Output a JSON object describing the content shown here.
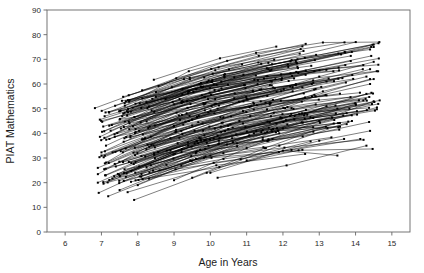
{
  "chart_data": {
    "type": "line",
    "title": "",
    "subtitle": "",
    "xlabel": "Age in Years",
    "ylabel": "PIAT Mathematics",
    "xlim": [
      5.5,
      15.5
    ],
    "ylim": [
      0,
      90
    ],
    "xticks": [
      6,
      7,
      8,
      9,
      10,
      11,
      12,
      13,
      14,
      15
    ],
    "yticks": [
      0,
      10,
      20,
      30,
      40,
      50,
      60,
      70,
      80,
      90
    ],
    "xtick_labels": [
      "6",
      "7",
      "8",
      "9",
      "10",
      "11",
      "12",
      "13",
      "14",
      "15"
    ],
    "ytick_labels": [
      "0",
      "10",
      "20",
      "30",
      "40",
      "50",
      "60",
      "70",
      "80",
      "90"
    ],
    "grid": false,
    "legend": false,
    "legend_position": "none",
    "marker": "filled-square",
    "marker_size": 2,
    "line_color": "#000000",
    "line_width": 0.5,
    "observed_x_range": [
      6.9,
      14.6
    ],
    "observed_y_range": [
      13,
      76
    ],
    "n_series_approx": 180,
    "series": [
      {
        "name": "child-001",
        "x": [
          6.9,
          8.9,
          10.9,
          12.9,
          14.4
        ],
        "values": [
          20,
          33,
          44,
          55,
          60
        ]
      },
      {
        "name": "child-002",
        "x": [
          6.9,
          8.9,
          10.9,
          12.9,
          14.3
        ],
        "values": [
          26,
          38,
          49,
          58,
          63
        ]
      },
      {
        "name": "child-003",
        "x": [
          7.0,
          9.0,
          11.0,
          13.0,
          14.5
        ],
        "values": [
          31,
          43,
          54,
          63,
          69
        ]
      },
      {
        "name": "child-004",
        "x": [
          7.1,
          9.1,
          11.1,
          13.1,
          14.5
        ],
        "values": [
          23,
          36,
          47,
          57,
          62
        ]
      },
      {
        "name": "child-005",
        "x": [
          7.2,
          9.2,
          11.2,
          13.2,
          14.4
        ],
        "values": [
          28,
          41,
          52,
          61,
          66
        ]
      },
      {
        "name": "child-006",
        "x": [
          7.5,
          9.5,
          11.5,
          13.5
        ],
        "values": [
          17,
          29,
          40,
          50
        ]
      },
      {
        "name": "child-007",
        "x": [
          7.6,
          9.6,
          11.6,
          13.6,
          14.5
        ],
        "values": [
          48,
          58,
          66,
          72,
          75
        ]
      },
      {
        "name": "child-008",
        "x": [
          7.7,
          9.7,
          11.7,
          13.7,
          14.5
        ],
        "values": [
          49,
          60,
          68,
          73,
          76
        ]
      },
      {
        "name": "child-009",
        "x": [
          7.9,
          9.9,
          11.9,
          13.9
        ],
        "values": [
          13,
          24,
          35,
          45
        ]
      },
      {
        "name": "child-010",
        "x": [
          8.0,
          10.0,
          12.0,
          14.0
        ],
        "values": [
          19,
          31,
          42,
          52
        ]
      },
      {
        "name": "child-011",
        "x": [
          8.2,
          10.2,
          12.2,
          14.2
        ],
        "values": [
          38,
          50,
          59,
          66
        ]
      },
      {
        "name": "child-012",
        "x": [
          8.4,
          10.4,
          12.4,
          14.4
        ],
        "values": [
          54,
          64,
          70,
          74
        ]
      },
      {
        "name": "child-013",
        "x": [
          8.6,
          10.6,
          12.6,
          14.3
        ],
        "values": [
          25,
          38,
          48,
          56
        ]
      },
      {
        "name": "child-014",
        "x": [
          8.8,
          10.8,
          12.8,
          14.4
        ],
        "values": [
          33,
          45,
          55,
          62
        ]
      },
      {
        "name": "child-015",
        "x": [
          9.0,
          11.0,
          13.0,
          14.5
        ],
        "values": [
          21,
          34,
          45,
          53
        ]
      },
      {
        "name": "child-016",
        "x": [
          9.2,
          11.2,
          13.2
        ],
        "values": [
          27,
          40,
          51
        ]
      },
      {
        "name": "child-017",
        "x": [
          9.5,
          11.5,
          13.4
        ],
        "values": [
          22,
          34,
          44
        ]
      },
      {
        "name": "child-018",
        "x": [
          10.0,
          12.0,
          13.5
        ],
        "values": [
          24,
          33,
          31
        ]
      },
      {
        "name": "child-019",
        "x": [
          10.2,
          12.1,
          14.3
        ],
        "values": [
          22,
          27,
          35
        ]
      },
      {
        "name": "child-020",
        "x": [
          11.0,
          13.0,
          14.4
        ],
        "values": [
          29,
          37,
          41
        ]
      }
    ]
  },
  "axes": {
    "x_title": "Age in Years",
    "y_title": "PIAT Mathematics"
  }
}
